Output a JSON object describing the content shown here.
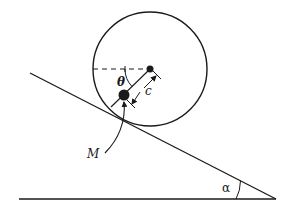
{
  "diagram": {
    "labels": {
      "theta": "θ",
      "offset": "c",
      "mass": "M",
      "angle": "α"
    },
    "colors": {
      "stroke": "#1a1a1a",
      "background": "#ffffff"
    }
  }
}
